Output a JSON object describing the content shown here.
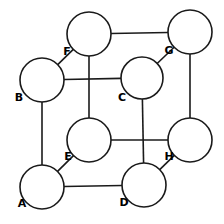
{
  "diagram": {
    "type": "graph-diagram",
    "canvas": {
      "width": 224,
      "height": 224,
      "background": "#ffffff"
    },
    "style": {
      "node_fill": "#ffffff",
      "node_stroke": "#1a1a1a",
      "node_stroke_width": 1.6,
      "node_radius": 22,
      "edge_stroke": "#1a1a1a",
      "edge_stroke_width": 1.6,
      "label_color": "#000000",
      "label_font_size": 11
    },
    "nodes": [
      {
        "id": "A",
        "label": "A",
        "cx": 42,
        "cy": 187,
        "r": 22,
        "label_x": 22,
        "label_y": 204
      },
      {
        "id": "B",
        "label": "B",
        "cx": 42,
        "cy": 80,
        "r": 22,
        "label_x": 19,
        "label_y": 98
      },
      {
        "id": "C",
        "label": "C",
        "cx": 142,
        "cy": 78,
        "r": 21,
        "label_x": 122,
        "label_y": 98
      },
      {
        "id": "D",
        "label": "D",
        "cx": 144,
        "cy": 185,
        "r": 22,
        "label_x": 124,
        "label_y": 203
      },
      {
        "id": "E",
        "label": "E",
        "cx": 89,
        "cy": 140,
        "r": 22,
        "label_x": 68,
        "label_y": 157
      },
      {
        "id": "F",
        "label": "F",
        "cx": 89,
        "cy": 34,
        "r": 22,
        "label_x": 67,
        "label_y": 52
      },
      {
        "id": "G",
        "label": "G",
        "cx": 190,
        "cy": 32,
        "r": 22,
        "label_x": 169,
        "label_y": 51
      },
      {
        "id": "H",
        "label": "H",
        "cx": 190,
        "cy": 140,
        "r": 22,
        "label_x": 169,
        "label_y": 157
      }
    ],
    "edges": [
      {
        "id": "A-B",
        "from": "A",
        "to": "B",
        "orientation": "vertical"
      },
      {
        "id": "A-D",
        "from": "A",
        "to": "D",
        "orientation": "horizontal"
      },
      {
        "id": "A-E",
        "from": "A",
        "to": "E",
        "orientation": "diagonal"
      },
      {
        "id": "B-C",
        "from": "B",
        "to": "C",
        "orientation": "horizontal"
      },
      {
        "id": "B-F",
        "from": "B",
        "to": "F",
        "orientation": "diagonal"
      },
      {
        "id": "C-D",
        "from": "C",
        "to": "D",
        "orientation": "vertical"
      },
      {
        "id": "C-G",
        "from": "C",
        "to": "G",
        "orientation": "diagonal"
      },
      {
        "id": "D-H",
        "from": "D",
        "to": "H",
        "orientation": "diagonal"
      },
      {
        "id": "E-F",
        "from": "E",
        "to": "F",
        "orientation": "vertical"
      },
      {
        "id": "E-H",
        "from": "E",
        "to": "H",
        "orientation": "horizontal"
      },
      {
        "id": "F-G",
        "from": "F",
        "to": "G",
        "orientation": "horizontal"
      },
      {
        "id": "G-H",
        "from": "G",
        "to": "H",
        "orientation": "vertical"
      }
    ]
  }
}
